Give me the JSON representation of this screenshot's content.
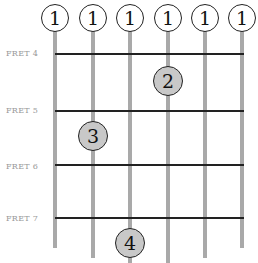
{
  "diagram": {
    "type": "guitar-chord-chart",
    "fret_labels": [
      "FRET 4",
      "FRET 5",
      "FRET 6",
      "FRET 7"
    ],
    "open_markers": [
      "1",
      "1",
      "1",
      "1",
      "1",
      "1"
    ],
    "fingers": [
      {
        "label": "2",
        "string": 4,
        "fret": 4
      },
      {
        "label": "3",
        "string": 2,
        "fret": 5
      },
      {
        "label": "4",
        "string": 3,
        "fret": 7
      }
    ],
    "colors": {
      "string": "#a9a9a9",
      "fret": "#222222",
      "finger_fill": "#c8c8c8",
      "label": "#999999"
    }
  }
}
